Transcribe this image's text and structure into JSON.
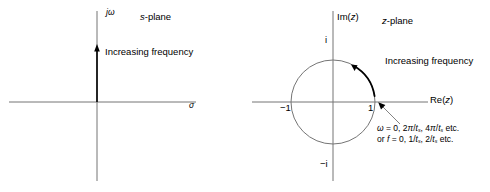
{
  "figure": {
    "type": "diagram",
    "background": "#ffffff",
    "stroke_color": "#6b6b6b",
    "emphasis_color": "#000000",
    "width": 490,
    "height": 192
  },
  "left_panel": {
    "name": "s-plane",
    "title": "s-plane",
    "vertical_axis_label": "jω",
    "horizontal_axis_label": "σ",
    "annotation": "Increasing frequency",
    "origin": {
      "x": 97,
      "y": 102
    },
    "ray": {
      "from_y": 102,
      "to_y": 47,
      "arrow": "up"
    }
  },
  "right_panel": {
    "name": "z-plane",
    "title": "z-plane",
    "vertical_axis_label": "Im(z)",
    "horizontal_axis_label": "Re(z)",
    "annotation": "Increasing frequency",
    "origin": {
      "x": 333,
      "y": 102
    },
    "unit_circle_radius": 42,
    "tick_labels": {
      "right": "1",
      "left": "−1",
      "top": "i",
      "bottom": "−i"
    },
    "arc": {
      "start_deg": -8,
      "end_deg": 62,
      "direction": "counterclockwise"
    },
    "callout": {
      "line1_prefix": "ω = 0, 2π/t",
      "line1_sub1": "s",
      "line1_mid": ", 4π/t",
      "line1_sub2": "s",
      "line1_suffix": " etc.",
      "line2_prefix": "or f = 0, 1/t",
      "line2_sub1": "s",
      "line2_mid": ", 2/t",
      "line2_sub2": "s",
      "line2_suffix": " etc."
    }
  }
}
